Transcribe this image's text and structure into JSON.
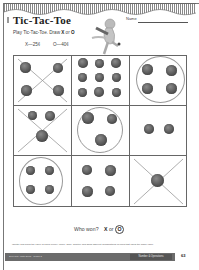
{
  "header": {
    "title": "Tic-Tac-Toe",
    "name_label": "Name"
  },
  "instructions": {
    "prefix": "Play Tic-Tac-Toe. Draw ",
    "x": "X",
    "or": " or ",
    "o": "O",
    "suffix": ".",
    "key_x": "X—25¢",
    "key_o": "O—40¢"
  },
  "board": {
    "cells": [
      {
        "row": 0,
        "col": 0,
        "mark": "X",
        "coins": 4
      },
      {
        "row": 0,
        "col": 1,
        "mark": "",
        "coins": 9
      },
      {
        "row": 0,
        "col": 2,
        "mark": "O",
        "coins": 4
      },
      {
        "row": 1,
        "col": 0,
        "mark": "X",
        "coins": 3
      },
      {
        "row": 1,
        "col": 1,
        "mark": "O",
        "coins": 3
      },
      {
        "row": 1,
        "col": 2,
        "mark": "",
        "coins": 2
      },
      {
        "row": 2,
        "col": 0,
        "mark": "O",
        "coins": 4
      },
      {
        "row": 2,
        "col": 1,
        "mark": "",
        "coins": 4
      },
      {
        "row": 2,
        "col": 2,
        "mark": "X",
        "coins": 1
      }
    ]
  },
  "question": {
    "label": "Who won?",
    "x": "X",
    "or": "or",
    "o": "O",
    "answer": "O"
  },
  "footer": {
    "standard": "Identify and know the value of coins (penny, nickel, dime, quarter) and show different combinations of coins that equal the same value.",
    "left_text": "Everyday Math Skills · Grade 2",
    "section": "Number & Operations",
    "page": "63"
  }
}
